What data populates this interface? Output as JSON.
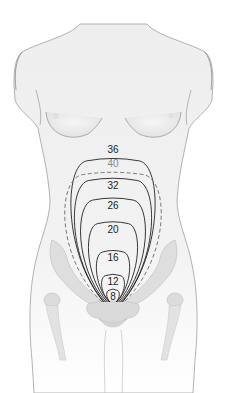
{
  "figure": {
    "colors": {
      "background": "#ffffff",
      "body_fill": "#eeeeee",
      "body_outline": "#9a9a9a",
      "bone_fill": "#dcdcdc",
      "contour_line": "#222222",
      "dashed_line": "#777777",
      "dashed_label": "#888888",
      "label_text": "#222222"
    },
    "contours": [
      {
        "week": "36",
        "style": "solid"
      },
      {
        "week": "40",
        "style": "dashed"
      },
      {
        "week": "32",
        "style": "solid"
      },
      {
        "week": "26",
        "style": "solid"
      },
      {
        "week": "20",
        "style": "solid"
      },
      {
        "week": "16",
        "style": "solid"
      },
      {
        "week": "12",
        "style": "solid"
      },
      {
        "week": "8",
        "style": "solid"
      }
    ]
  }
}
